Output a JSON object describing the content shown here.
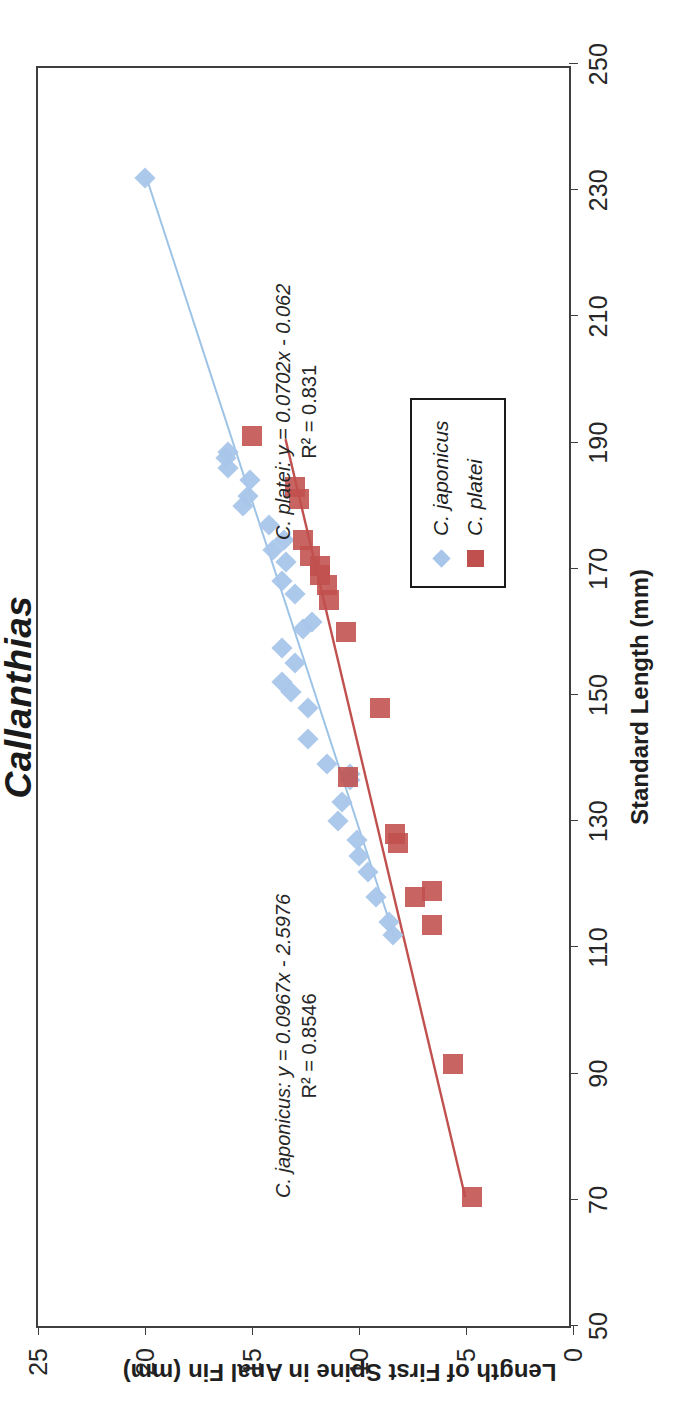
{
  "chart_data": {
    "type": "scatter",
    "title": "Callanthias",
    "xlabel": "Standard Length (mm)",
    "ylabel": "Length of First Spine in Anal Fin (mm)",
    "xlim": [
      50,
      250
    ],
    "ylim": [
      0,
      25
    ],
    "xticks": [
      50,
      70,
      90,
      110,
      130,
      150,
      170,
      190,
      210,
      230,
      250
    ],
    "yticks": [
      0,
      5,
      10,
      15,
      20,
      25
    ],
    "grid": false,
    "legend_position": "inside-lower-right",
    "series": [
      {
        "name": "C. japonicus",
        "marker": "diamond",
        "color": "#a8c6ea",
        "trendline_color": "#9dc3e6",
        "equation": "y = 0.0967x - 2.5976",
        "r2": "R² = 0.8546",
        "annotation": "C. japonicus: y = 0.0967x - 2.5976",
        "slope": 0.0967,
        "intercept": -2.5976,
        "points": [
          [
            112.0,
            8.4
          ],
          [
            114.0,
            8.6
          ],
          [
            118.0,
            9.2
          ],
          [
            122.0,
            9.6
          ],
          [
            124.5,
            10.0
          ],
          [
            127.0,
            10.1
          ],
          [
            130.0,
            11.0
          ],
          [
            133.0,
            10.8
          ],
          [
            136.5,
            10.4
          ],
          [
            137.5,
            10.4
          ],
          [
            139.0,
            11.5
          ],
          [
            143.0,
            12.4
          ],
          [
            148.0,
            12.4
          ],
          [
            150.5,
            13.2
          ],
          [
            152.0,
            13.6
          ],
          [
            155.0,
            13.0
          ],
          [
            157.5,
            13.6
          ],
          [
            160.5,
            12.6
          ],
          [
            161.5,
            12.2
          ],
          [
            166.0,
            13.0
          ],
          [
            168.0,
            13.6
          ],
          [
            171.0,
            13.4
          ],
          [
            173.0,
            14.0
          ],
          [
            174.5,
            13.5
          ],
          [
            177.0,
            14.2
          ],
          [
            180.0,
            15.4
          ],
          [
            181.5,
            15.2
          ],
          [
            184.0,
            15.1
          ],
          [
            186.0,
            16.1
          ],
          [
            187.5,
            16.2
          ],
          [
            188.5,
            16.1
          ],
          [
            232.0,
            20.0
          ]
        ]
      },
      {
        "name": "C. platei",
        "marker": "square",
        "color": "#c0504d",
        "trendline_color": "#c0504d",
        "equation": "y = 0.0702x - 0.062",
        "r2": "R² = 0.831",
        "annotation": "C. platei: y = 0.0702x - 0.062",
        "slope": 0.0702,
        "intercept": -0.062,
        "points": [
          [
            70.5,
            4.7
          ],
          [
            91.5,
            5.6
          ],
          [
            113.5,
            6.6
          ],
          [
            118.0,
            7.4
          ],
          [
            119.0,
            6.6
          ],
          [
            126.5,
            8.2
          ],
          [
            128.0,
            8.3
          ],
          [
            137.0,
            10.5
          ],
          [
            148.0,
            9.0
          ],
          [
            160.0,
            10.6
          ],
          [
            165.0,
            11.4
          ],
          [
            167.5,
            11.5
          ],
          [
            169.0,
            11.8
          ],
          [
            170.5,
            11.8
          ],
          [
            172.0,
            12.3
          ],
          [
            174.5,
            12.6
          ],
          [
            181.0,
            12.8
          ],
          [
            183.0,
            13.0
          ],
          [
            191.0,
            15.0
          ]
        ]
      }
    ]
  },
  "legend": {
    "items": [
      {
        "label": "C. japonicus",
        "marker": "diamond",
        "color": "#a8c6ea"
      },
      {
        "label": "C. platei",
        "marker": "square",
        "color": "#c0504d"
      }
    ]
  },
  "annotations": {
    "japonicus_line1": "C. japonicus: y = 0.0967x - 2.5976",
    "japonicus_line2": "R² = 0.8546",
    "platei_line1": "C. platei: y = 0.0702x - 0.062",
    "platei_line2": "R² = 0.831"
  },
  "axes": {
    "x_title": "Standard Length (mm)",
    "y_title": "Length of First Spine in Anal Fin (mm)",
    "x_ticks": [
      "50",
      "70",
      "90",
      "110",
      "130",
      "150",
      "170",
      "190",
      "210",
      "230",
      "250"
    ],
    "y_ticks": [
      "0",
      "5",
      "10",
      "15",
      "20",
      "25"
    ]
  },
  "title": {
    "text": "Callanthias"
  },
  "colors": {
    "japonicus": "#a8c6ea",
    "platei": "#c0504d",
    "axis": "#3f3f3f",
    "text": "#262626"
  }
}
